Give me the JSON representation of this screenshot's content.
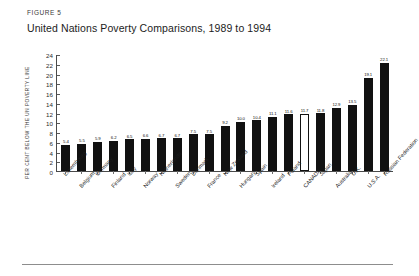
{
  "header": {
    "figure_label": "FIGURE 5",
    "title": "United Nations Poverty Comparisons, 1989 to 1994"
  },
  "chart_data": {
    "type": "bar",
    "title": "United Nations Poverty Comparisons, 1989 to 1994",
    "xlabel": "",
    "ylabel": "PER CENT BELOW THE UN POVERTY LINE",
    "ylim": [
      0,
      24
    ],
    "ytick_step": 2,
    "yticks": [
      0,
      2,
      4,
      6,
      8,
      10,
      12,
      14,
      16,
      18,
      20,
      22,
      24
    ],
    "grid": false,
    "legend": "none",
    "highlight_category": "CANADA",
    "highlight_style": "hollow-white-bar-with-black-outline",
    "bar_color": "#111111",
    "highlight_bar_color": "#ffffff",
    "categories": [
      "Luxembourg",
      "Belgium",
      "Germany",
      "Finland",
      "Italy",
      "Norway",
      "Netherlands",
      "Sweden",
      "Denmark",
      "France",
      "New Zealand",
      "Hungary",
      "Spain",
      "Ireland",
      "Poland",
      "CANADA",
      "Japan",
      "Australia",
      "U.K.",
      "U.S.A.",
      "Russian Federation"
    ],
    "values": [
      5.4,
      5.5,
      5.9,
      6.2,
      6.5,
      6.6,
      6.7,
      6.7,
      7.5,
      7.5,
      9.2,
      10.0,
      10.4,
      11.1,
      11.6,
      11.7,
      11.8,
      12.9,
      13.5,
      19.1,
      22.1
    ],
    "value_labels": [
      "5.4",
      "5.5",
      "5.9",
      "6.2",
      "6.5",
      "6.6",
      "6.7",
      "6.7",
      "7.5",
      "7.5",
      "9.2",
      "10.0",
      "10.4",
      "11.1",
      "11.6",
      "11.7",
      "11.8",
      "12.9",
      "13.5",
      "19.1",
      "22.1"
    ]
  }
}
